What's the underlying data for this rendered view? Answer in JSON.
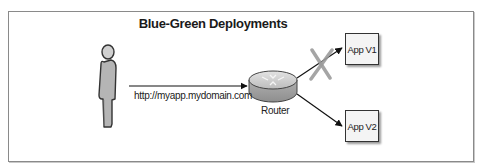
{
  "diagram": {
    "title": "Blue-Green Deployments",
    "user": {
      "icon": "person-icon"
    },
    "request": {
      "url_label": "http://myapp.mydomain.com"
    },
    "router": {
      "label": "Router",
      "icon": "router-icon"
    },
    "targets": [
      {
        "label": "App V1",
        "status": "disconnected",
        "marker": "x-cross-icon"
      },
      {
        "label": "App V2",
        "status": "active"
      }
    ],
    "colors": {
      "frame_border": "#8a8a8a",
      "person_fill": "#b5b5b5",
      "router_fill": "#bdbdbd",
      "cross": "#9c9c9c",
      "arrow": "#111111"
    }
  }
}
